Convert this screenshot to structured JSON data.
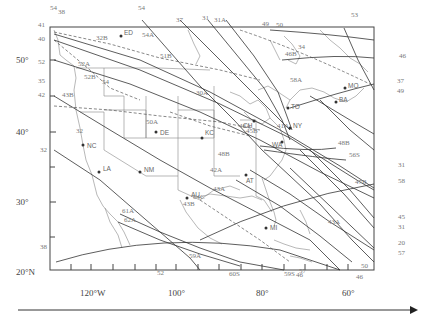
{
  "map": {
    "frame": {
      "left": 50,
      "top": 27,
      "right": 374,
      "bottom": 270
    },
    "lat_ticks": [
      {
        "label": "50°",
        "y": 60
      },
      {
        "label": "40°",
        "y": 132
      },
      {
        "label": "30°",
        "y": 202
      },
      {
        "label": "20°N",
        "y": 272
      }
    ],
    "lon_ticks": [
      {
        "label": "120°W",
        "x": 91
      },
      {
        "label": "100°",
        "x": 176
      },
      {
        "label": "80°",
        "x": 262
      },
      {
        "label": "60°",
        "x": 348
      }
    ],
    "cities": [
      {
        "code": "ED",
        "x": 121,
        "y": 36
      },
      {
        "code": "MO",
        "x": 352,
        "y": 83
      },
      {
        "code": "TO",
        "x": 291,
        "y": 106
      },
      {
        "code": "BA",
        "x": 335,
        "y": 101
      },
      {
        "code": "CH",
        "x": 256,
        "y": 139
      },
      {
        "code": "KC",
        "x": 240,
        "y": 151
      },
      {
        "code": "NC",
        "x": 83,
        "y": 173
      },
      {
        "code": "DE",
        "x": 156,
        "y": 134
      },
      {
        "code": "NM",
        "x": 140,
        "y": 176
      },
      {
        "code": "LA",
        "x": 99,
        "y": 196
      },
      {
        "code": "AT",
        "x": 246,
        "y": 175
      },
      {
        "code": "AU",
        "x": 187,
        "y": 195
      },
      {
        "code": "WA",
        "x": 279,
        "y": 146
      },
      {
        "code": "NY",
        "x": 281,
        "y": 128
      },
      {
        "code": "MI",
        "x": 272,
        "y": 208
      }
    ],
    "track_labels": [
      {
        "text": "54",
        "x": 50,
        "y": 10
      },
      {
        "text": "38",
        "x": 58,
        "y": 14
      },
      {
        "text": "41",
        "x": 38,
        "y": 27
      },
      {
        "text": "40",
        "x": 38,
        "y": 41
      },
      {
        "text": "52",
        "x": 38,
        "y": 64
      },
      {
        "text": "35",
        "x": 38,
        "y": 83
      },
      {
        "text": "42",
        "x": 38,
        "y": 97
      },
      {
        "text": "32",
        "x": 40,
        "y": 152
      },
      {
        "text": "38",
        "x": 40,
        "y": 249
      },
      {
        "text": "52A",
        "x": 78,
        "y": 66
      },
      {
        "text": "52B",
        "x": 84,
        "y": 79
      },
      {
        "text": "54",
        "x": 102,
        "y": 84
      },
      {
        "text": "32B",
        "x": 96,
        "y": 40
      },
      {
        "text": "43B",
        "x": 62,
        "y": 97
      },
      {
        "text": "32",
        "x": 76,
        "y": 133
      },
      {
        "text": "54",
        "x": 138,
        "y": 10
      },
      {
        "text": "54A",
        "x": 142,
        "y": 37
      },
      {
        "text": "51B",
        "x": 160,
        "y": 58
      },
      {
        "text": "37",
        "x": 176,
        "y": 22
      },
      {
        "text": "31",
        "x": 202,
        "y": 20
      },
      {
        "text": "31A",
        "x": 214,
        "y": 22
      },
      {
        "text": "49",
        "x": 262,
        "y": 26
      },
      {
        "text": "50",
        "x": 276,
        "y": 27
      },
      {
        "text": "34",
        "x": 298,
        "y": 49
      },
      {
        "text": "46B",
        "x": 285,
        "y": 56
      },
      {
        "text": "50A",
        "x": 146,
        "y": 124
      },
      {
        "text": "30A",
        "x": 196,
        "y": 95
      },
      {
        "text": "46A",
        "x": 239,
        "y": 128
      },
      {
        "text": "45B",
        "x": 246,
        "y": 133
      },
      {
        "text": "48B",
        "x": 218,
        "y": 156
      },
      {
        "text": "41A",
        "x": 277,
        "y": 128
      },
      {
        "text": "58A",
        "x": 290,
        "y": 82
      },
      {
        "text": "53",
        "x": 351,
        "y": 17
      },
      {
        "text": "46",
        "x": 399,
        "y": 58
      },
      {
        "text": "37",
        "x": 397,
        "y": 83
      },
      {
        "text": "49",
        "x": 397,
        "y": 93
      },
      {
        "text": "48B",
        "x": 338,
        "y": 145
      },
      {
        "text": "56S",
        "x": 349,
        "y": 157
      },
      {
        "text": "47B",
        "x": 355,
        "y": 184
      },
      {
        "text": "31",
        "x": 398,
        "y": 167
      },
      {
        "text": "58",
        "x": 398,
        "y": 183
      },
      {
        "text": "43A",
        "x": 328,
        "y": 224
      },
      {
        "text": "45",
        "x": 398,
        "y": 219
      },
      {
        "text": "31",
        "x": 398,
        "y": 229
      },
      {
        "text": "20",
        "x": 398,
        "y": 245
      },
      {
        "text": "57",
        "x": 398,
        "y": 255
      },
      {
        "text": "50",
        "x": 361,
        "y": 268
      },
      {
        "text": "46",
        "x": 356,
        "y": 279
      },
      {
        "text": "42A",
        "x": 210,
        "y": 172
      },
      {
        "text": "43A",
        "x": 213,
        "y": 191
      },
      {
        "text": "43B",
        "x": 183,
        "y": 206
      },
      {
        "text": "64C",
        "x": 193,
        "y": 199
      },
      {
        "text": "61A",
        "x": 122,
        "y": 213
      },
      {
        "text": "62A",
        "x": 124,
        "y": 222
      },
      {
        "text": "59A",
        "x": 189,
        "y": 258
      },
      {
        "text": "60S",
        "x": 229,
        "y": 276
      },
      {
        "text": "59S",
        "x": 284,
        "y": 276
      },
      {
        "text": "46",
        "x": 296,
        "y": 277
      },
      {
        "text": "52",
        "x": 157,
        "y": 275
      },
      {
        "text": "57",
        "x": 299,
        "y": 273
      }
    ]
  },
  "axis": {
    "arrow_label": ""
  }
}
